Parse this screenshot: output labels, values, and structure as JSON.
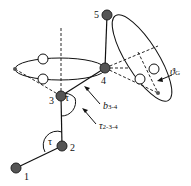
{
  "atoms": [
    {
      "id": "1",
      "label": "1",
      "x": 16,
      "y": 168
    },
    {
      "id": "2",
      "label": "2",
      "x": 62,
      "y": 146
    },
    {
      "id": "3",
      "label": "3",
      "x": 61,
      "y": 96
    },
    {
      "id": "4",
      "label": "4",
      "x": 105,
      "y": 68
    },
    {
      "id": "5",
      "label": "5",
      "x": 107,
      "y": 15
    }
  ],
  "labels": {
    "tau": "τ",
    "b_main": "b",
    "b_sub": "3-4",
    "tau_main": "τ",
    "tau_sub": "2-3-4",
    "theta_main": "ϑ",
    "theta_sub": "G"
  },
  "colors": {
    "atom_fill": "#555555",
    "line": "#111111",
    "background": "#ffffff"
  }
}
